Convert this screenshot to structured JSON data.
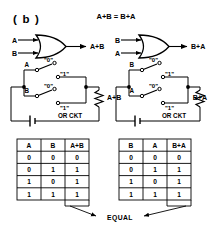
{
  "figure": {
    "panel_label": "( b )",
    "equation": "A+B = B+A"
  },
  "gates": {
    "left": {
      "type": "or-gate",
      "input_top": "A",
      "input_bottom": "B",
      "output": "A+B"
    },
    "right": {
      "type": "or-gate",
      "input_top": "B",
      "input_bottom": "A",
      "output": "B+A"
    }
  },
  "circuits": {
    "left": {
      "caption": "OR CKT",
      "switch_top_label": "A",
      "switch_bottom_label": "B",
      "contact_open": "\"0\"",
      "contact_closed": "\"1\"",
      "output": "A+B"
    },
    "right": {
      "caption": "OR CKT",
      "switch_top_label": "B",
      "switch_bottom_label": "A",
      "contact_open": "\"0\"",
      "contact_closed": "\"1\"",
      "output": "B+A"
    }
  },
  "tables": {
    "left": {
      "headers": [
        "A",
        "B",
        "A+B"
      ],
      "rows": [
        [
          "0",
          "0",
          "0"
        ],
        [
          "0",
          "1",
          "1"
        ],
        [
          "1",
          "0",
          "1"
        ],
        [
          "1",
          "1",
          "1"
        ]
      ]
    },
    "right": {
      "headers": [
        "B",
        "A",
        "B+A"
      ],
      "rows": [
        [
          "0",
          "0",
          "0"
        ],
        [
          "0",
          "1",
          "1"
        ],
        [
          "1",
          "0",
          "1"
        ],
        [
          "1",
          "1",
          "1"
        ]
      ]
    }
  },
  "annotation": {
    "equal_label": "EQUAL"
  },
  "colors": {
    "ink": "#000000",
    "paper": "#ffffff"
  }
}
